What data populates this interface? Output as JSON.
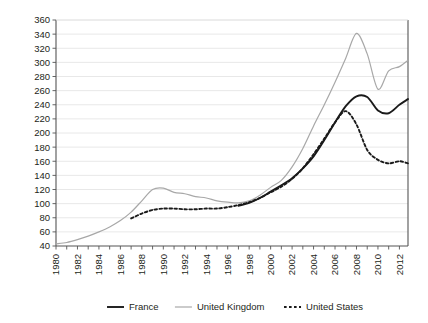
{
  "chart_data": {
    "type": "line",
    "title": "",
    "subtitle": "",
    "xlabel": "",
    "ylabel": "",
    "xlim": [
      1980,
      2012.8
    ],
    "ylim": [
      40,
      360
    ],
    "ytick_step": 20,
    "xtick_step": 1,
    "xtick_label_step": 2,
    "grid": true,
    "grid_axis": "y",
    "legend_position": "bottom",
    "yticks": [
      40,
      60,
      80,
      100,
      120,
      140,
      160,
      180,
      200,
      220,
      240,
      260,
      280,
      300,
      320,
      340,
      360
    ],
    "xticks": [
      1980,
      1981,
      1982,
      1983,
      1984,
      1985,
      1986,
      1987,
      1988,
      1989,
      1990,
      1991,
      1992,
      1993,
      1994,
      1995,
      1996,
      1997,
      1998,
      1999,
      2000,
      2001,
      2002,
      2003,
      2004,
      2005,
      2006,
      2007,
      2008,
      2009,
      2010,
      2011,
      2012
    ],
    "xtick_labels": [
      "1980",
      "1982",
      "1984",
      "1986",
      "1988",
      "1990",
      "1992",
      "1994",
      "1996",
      "1998",
      "2000",
      "2002",
      "2004",
      "2006",
      "2008",
      "2010",
      "2012"
    ],
    "series": [
      {
        "name": "France",
        "color": "#1a1a1a",
        "style": "solid",
        "width": 1.9,
        "x": [
          1997,
          1998,
          1999,
          2000,
          2001,
          2002,
          2003,
          2004,
          2005,
          2006,
          2007,
          2008,
          2009,
          2010,
          2011,
          2012,
          2012.8
        ],
        "values": [
          97,
          101,
          108,
          117,
          126,
          136,
          150,
          167,
          190,
          215,
          238,
          252,
          251,
          232,
          228,
          240,
          248
        ]
      },
      {
        "name": "United Kingdom",
        "color": "#a8a8a8",
        "style": "solid",
        "width": 1.2,
        "x": [
          1980,
          1981,
          1982,
          1983,
          1984,
          1985,
          1986,
          1987,
          1988,
          1989,
          1990,
          1991,
          1992,
          1993,
          1994,
          1995,
          1996,
          1997,
          1998,
          1999,
          2000,
          2001,
          2002,
          2003,
          2004,
          2005,
          2006,
          2007,
          2008,
          2009,
          2010,
          2011,
          2012,
          2012.8
        ],
        "values": [
          43,
          45,
          49,
          54,
          60,
          67,
          76,
          88,
          104,
          120,
          122,
          116,
          114,
          110,
          108,
          104,
          102,
          101,
          104,
          112,
          123,
          133,
          152,
          178,
          210,
          240,
          272,
          306,
          341,
          312,
          262,
          288,
          294,
          303
        ]
      },
      {
        "name": "United States",
        "color": "#1a1a1a",
        "style": "dotted",
        "width": 1.9,
        "x": [
          1987,
          1988,
          1989,
          1990,
          1991,
          1992,
          1993,
          1994,
          1995,
          1996,
          1997,
          1998,
          1999,
          2000,
          2001,
          2002,
          2003,
          2004,
          2005,
          2006,
          2007,
          2008,
          2009,
          2010,
          2011,
          2012,
          2012.8
        ],
        "values": [
          79,
          86,
          91,
          93,
          93,
          92,
          92,
          93,
          93,
          95,
          98,
          102,
          108,
          116,
          124,
          135,
          150,
          170,
          192,
          215,
          231,
          212,
          176,
          162,
          157,
          160,
          157
        ]
      }
    ]
  },
  "legend": {
    "items": [
      {
        "label": "France",
        "color": "#1a1a1a",
        "style": "solid"
      },
      {
        "label": "United Kingdom",
        "color": "#a8a8a8",
        "style": "solid"
      },
      {
        "label": "United States",
        "color": "#1a1a1a",
        "style": "dotted"
      }
    ]
  },
  "colors": {
    "axis": "#555555",
    "grid": "#e2e2e2",
    "text": "#231f20",
    "background": "#ffffff"
  }
}
